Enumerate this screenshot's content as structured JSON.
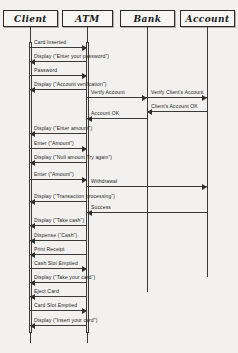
{
  "diagram": {
    "type": "uml-sequence-diagram",
    "background_color": "#f2f1ef",
    "line_color": "#3a3a3a"
  },
  "lifelines": [
    {
      "id": "client",
      "label": "Client",
      "x": 30,
      "box_left": 3,
      "box_width": 55,
      "top": 10,
      "bottom": 343
    },
    {
      "id": "atm",
      "label": "ATM",
      "x": 87,
      "box_left": 62,
      "box_width": 51,
      "top": 10,
      "bottom": 343
    },
    {
      "id": "bank",
      "label": "Bank",
      "x": 147,
      "box_left": 120,
      "box_width": 55,
      "top": 10,
      "bottom": 292
    },
    {
      "id": "account",
      "label": "Account",
      "x": 207,
      "box_left": 180,
      "box_width": 55,
      "top": 10,
      "bottom": 277
    }
  ],
  "messages": [
    {
      "label": "Card Inserted",
      "from": "client",
      "to": "atm",
      "y": 47,
      "dir": "right"
    },
    {
      "label": "Display (\"Enter your password\")",
      "from": "atm",
      "to": "client",
      "y": 61,
      "dir": "left"
    },
    {
      "label": "Password",
      "from": "client",
      "to": "atm",
      "y": 75,
      "dir": "right"
    },
    {
      "label": "Display (\"Account verification\")",
      "from": "atm",
      "to": "client",
      "y": 89,
      "dir": "left"
    },
    {
      "label": "Verify Account",
      "from": "atm",
      "to": "bank",
      "y": 97,
      "dir": "right"
    },
    {
      "label": "Verify Client's Account",
      "from": "bank",
      "to": "account",
      "y": 97,
      "dir": "right"
    },
    {
      "label": "Client's Account OK",
      "from": "account",
      "to": "bank",
      "y": 111,
      "dir": "left"
    },
    {
      "label": "Account OK",
      "from": "bank",
      "to": "atm",
      "y": 118,
      "dir": "left"
    },
    {
      "label": "Display (\"Enter amount\")",
      "from": "atm",
      "to": "client",
      "y": 133,
      "dir": "left"
    },
    {
      "label": "Enter (\"Amount\")",
      "from": "client",
      "to": "atm",
      "y": 148,
      "dir": "right"
    },
    {
      "label": "Display (\"Null amount Try again\")",
      "from": "atm",
      "to": "client",
      "y": 162,
      "dir": "left"
    },
    {
      "label": "Enter (\"Amount\")",
      "from": "client",
      "to": "atm",
      "y": 179,
      "dir": "right"
    },
    {
      "label": "Withdrawal",
      "from": "atm",
      "to": "account",
      "y": 186,
      "dir": "right"
    },
    {
      "label": "Display (\"Transaction processing\")",
      "from": "atm",
      "to": "client",
      "y": 201,
      "dir": "left"
    },
    {
      "label": "Success",
      "from": "account",
      "to": "atm",
      "y": 212,
      "dir": "left"
    },
    {
      "label": "Display (\"Take cash\")",
      "from": "atm",
      "to": "client",
      "y": 225,
      "dir": "left"
    },
    {
      "label": "Dispense (\"Cash\")",
      "from": "atm",
      "to": "client",
      "y": 240,
      "dir": "left"
    },
    {
      "label": "Print Receipt",
      "from": "atm",
      "to": "client",
      "y": 254,
      "dir": "left"
    },
    {
      "label": "Cash Slot Emptied",
      "from": "client",
      "to": "atm",
      "y": 268,
      "dir": "right"
    },
    {
      "label": "Display (\"Take your card\")",
      "from": "atm",
      "to": "client",
      "y": 282,
      "dir": "left"
    },
    {
      "label": "Eject Card",
      "from": "atm",
      "to": "client",
      "y": 296,
      "dir": "left"
    },
    {
      "label": "Card Slot Emptied",
      "from": "client",
      "to": "atm",
      "y": 310,
      "dir": "right"
    },
    {
      "label": "Display (\"Insert your card\")",
      "from": "atm",
      "to": "client",
      "y": 325,
      "dir": "left"
    }
  ]
}
